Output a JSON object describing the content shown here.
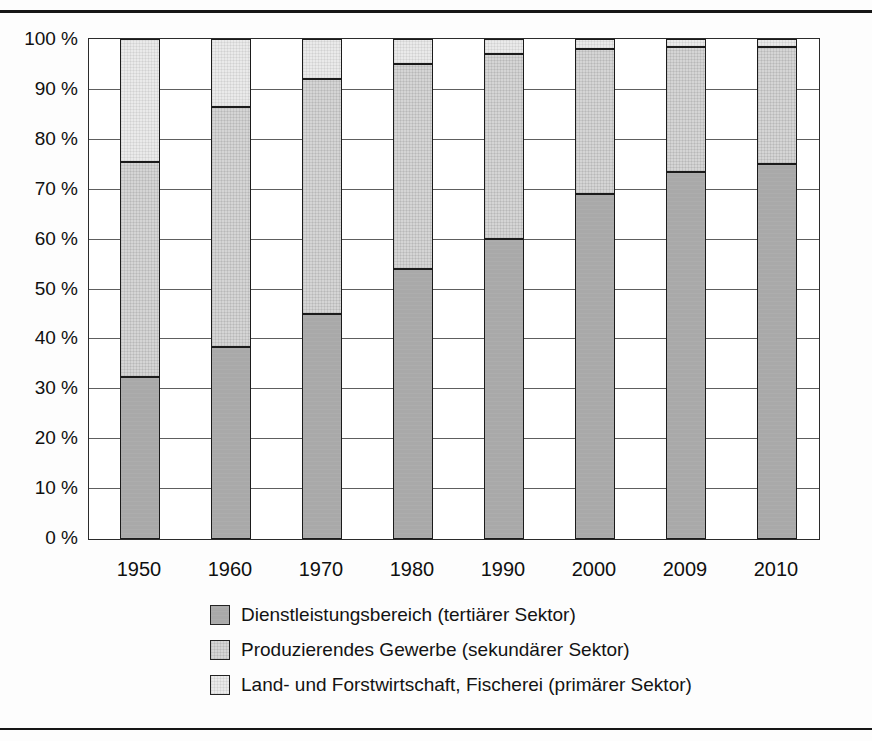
{
  "chart_data": {
    "type": "bar",
    "stacked": true,
    "stack_total": 100,
    "categories": [
      "1950",
      "1960",
      "1970",
      "1980",
      "1990",
      "2000",
      "2009",
      "2010"
    ],
    "series": [
      {
        "key": "tertiary-sector",
        "name": "Dienstleistungsbereich (tertiärer Sektor)",
        "values": [
          32.5,
          38.5,
          45,
          54,
          60,
          69,
          73.5,
          75
        ],
        "color": "#a9a9a9",
        "pattern": "solid"
      },
      {
        "key": "secondary-sector",
        "name": "Produzierendes Gewerbe (sekundärer Sektor)",
        "values": [
          43,
          48,
          47,
          41,
          37,
          29,
          25,
          23.5
        ],
        "color": "#d5d5d5",
        "pattern": "grid"
      },
      {
        "key": "primary-sector",
        "name": "Land- und Forstwirtschaft, Fischerei (primärer Sektor)",
        "values": [
          24.5,
          13.5,
          8,
          5,
          3,
          2,
          1.5,
          1.5
        ],
        "color": "#eaeaea",
        "pattern": "grid-light"
      }
    ],
    "yticks": [
      {
        "value": 100,
        "label": "100 %"
      },
      {
        "value": 90,
        "label": "90 %"
      },
      {
        "value": 80,
        "label": "80 %"
      },
      {
        "value": 70,
        "label": "70 %"
      },
      {
        "value": 60,
        "label": "60 %"
      },
      {
        "value": 50,
        "label": "50 %"
      },
      {
        "value": 40,
        "label": "40 %"
      },
      {
        "value": 30,
        "label": "30 %"
      },
      {
        "value": 20,
        "label": "20 %"
      },
      {
        "value": 10,
        "label": "10 %"
      },
      {
        "value": 0,
        "label": "0 %"
      }
    ],
    "ylim": [
      0,
      100
    ],
    "grid": true,
    "legend_position": "below-chart"
  }
}
